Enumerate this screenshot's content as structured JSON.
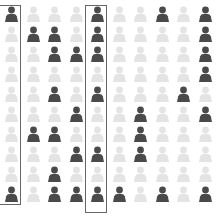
{
  "chart_data": {
    "type": "table",
    "title": "",
    "rows": 10,
    "columns": 10,
    "legend": [
      {
        "label": "selected",
        "color": "#4a4a4a"
      },
      {
        "label": "unselected",
        "color": "#e4e4e4"
      }
    ],
    "grid": [
      [
        1,
        0,
        0,
        0,
        1,
        0,
        0,
        1,
        0,
        1
      ],
      [
        0,
        1,
        1,
        0,
        1,
        0,
        0,
        0,
        0,
        1
      ],
      [
        0,
        0,
        1,
        1,
        1,
        0,
        0,
        0,
        0,
        1
      ],
      [
        0,
        0,
        0,
        0,
        0,
        0,
        0,
        0,
        0,
        1
      ],
      [
        0,
        0,
        1,
        0,
        1,
        0,
        0,
        0,
        1,
        0
      ],
      [
        0,
        0,
        0,
        1,
        0,
        0,
        1,
        0,
        0,
        1
      ],
      [
        0,
        1,
        1,
        0,
        0,
        0,
        1,
        0,
        0,
        0
      ],
      [
        0,
        0,
        0,
        1,
        1,
        0,
        1,
        0,
        0,
        0
      ],
      [
        0,
        0,
        1,
        0,
        0,
        0,
        0,
        0,
        0,
        0
      ],
      [
        1,
        0,
        1,
        1,
        1,
        1,
        0,
        1,
        0,
        1
      ]
    ],
    "highlighted_columns": [
      1,
      5
    ],
    "column_totals": [
      2,
      2,
      6,
      4,
      6,
      1,
      3,
      2,
      1,
      6
    ],
    "total_selected": 33
  },
  "colors": {
    "dark": "#4a4a4a",
    "light": "#e4e4e4",
    "box": "#666666"
  }
}
